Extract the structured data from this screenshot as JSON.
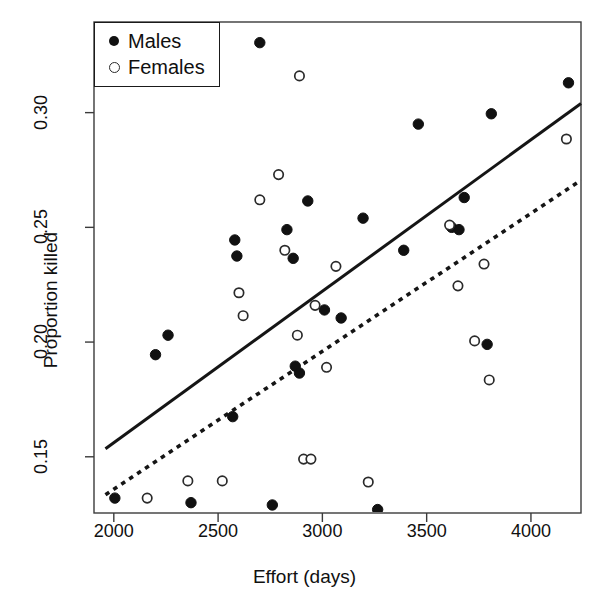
{
  "chart_data": {
    "type": "scatter",
    "title": "",
    "xlabel": "Effort (days)",
    "ylabel": "Proportion killed",
    "xlim": [
      1905,
      4240
    ],
    "ylim": [
      0.1255,
      0.3395
    ],
    "xticks": [
      2000,
      2500,
      3000,
      3500,
      4000
    ],
    "yticks": [
      0.15,
      0.2,
      0.25,
      0.3
    ],
    "xtick_labels": [
      "2000",
      "2500",
      "3000",
      "3500",
      "4000"
    ],
    "ytick_labels": [
      "0.15",
      "0.20",
      "0.25",
      "0.30"
    ],
    "grid": false,
    "legend_position": "top-left",
    "legend": [
      {
        "label": "Males",
        "marker": "filled-circle",
        "color": "#111111"
      },
      {
        "label": "Females",
        "marker": "open-circle",
        "color": "#2a2a2a"
      }
    ],
    "series": [
      {
        "name": "Males",
        "marker": "filled-circle",
        "points": [
          [
            2005,
            0.132
          ],
          [
            2200,
            0.1945
          ],
          [
            2260,
            0.203
          ],
          [
            2370,
            0.13
          ],
          [
            2580,
            0.2445
          ],
          [
            2590,
            0.2375
          ],
          [
            2570,
            0.1675
          ],
          [
            2700,
            0.3305
          ],
          [
            2760,
            0.129
          ],
          [
            2830,
            0.249
          ],
          [
            2860,
            0.2365
          ],
          [
            2870,
            0.1895
          ],
          [
            2890,
            0.1865
          ],
          [
            2930,
            0.2615
          ],
          [
            3010,
            0.214
          ],
          [
            3090,
            0.2105
          ],
          [
            3195,
            0.254
          ],
          [
            3265,
            0.127
          ],
          [
            3390,
            0.24
          ],
          [
            3460,
            0.295
          ],
          [
            3620,
            0.25
          ],
          [
            3655,
            0.249
          ],
          [
            3680,
            0.263
          ],
          [
            3790,
            0.199
          ],
          [
            3810,
            0.2995
          ],
          [
            4180,
            0.313
          ]
        ]
      },
      {
        "name": "Females",
        "marker": "open-circle",
        "points": [
          [
            2160,
            0.132
          ],
          [
            2355,
            0.1395
          ],
          [
            2520,
            0.1395
          ],
          [
            2600,
            0.2215
          ],
          [
            2620,
            0.2115
          ],
          [
            2700,
            0.262
          ],
          [
            2790,
            0.273
          ],
          [
            2820,
            0.24
          ],
          [
            2880,
            0.203
          ],
          [
            2890,
            0.316
          ],
          [
            2910,
            0.149
          ],
          [
            2945,
            0.149
          ],
          [
            2965,
            0.216
          ],
          [
            3020,
            0.189
          ],
          [
            3065,
            0.233
          ],
          [
            3220,
            0.139
          ],
          [
            3610,
            0.251
          ],
          [
            3650,
            0.2245
          ],
          [
            3730,
            0.2005
          ],
          [
            3775,
            0.234
          ],
          [
            3800,
            0.1835
          ],
          [
            4170,
            0.2885
          ]
        ]
      }
    ],
    "trend_lines": [
      {
        "name": "Males fit",
        "style": "solid",
        "color": "#151515",
        "x_start": 1960,
        "y_start": 0.1535,
        "x_end": 4240,
        "y_end": 0.304
      },
      {
        "name": "Females fit",
        "style": "dotted",
        "color": "#151515",
        "x_start": 1960,
        "y_start": 0.1335,
        "x_end": 4240,
        "y_end": 0.2705
      }
    ]
  }
}
